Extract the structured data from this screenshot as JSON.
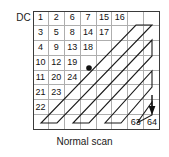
{
  "figure": {
    "dc_label": "DC",
    "caption": "Normal scan",
    "grid": {
      "rows": 8,
      "cols": 8,
      "cells": [
        [
          "1",
          "2",
          "6",
          "7",
          "15",
          "16",
          "",
          ""
        ],
        [
          "3",
          "5",
          "8",
          "14",
          "17",
          "",
          "",
          ""
        ],
        [
          "4",
          "9",
          "13",
          "18",
          "",
          "",
          "",
          ""
        ],
        [
          "10",
          "12",
          "19",
          "",
          "",
          "",
          "",
          ""
        ],
        [
          "11",
          "20",
          "24",
          "",
          "",
          "",
          "",
          ""
        ],
        [
          "21",
          "23",
          "",
          "",
          "",
          "",
          "",
          ""
        ],
        [
          "22",
          "",
          "",
          "",
          "",
          "",
          "",
          ""
        ],
        [
          "",
          "",
          "",
          "",
          "",
          "",
          "63",
          "64"
        ]
      ]
    },
    "markers": {
      "dot_label": "scan-position-dot",
      "dot_cell": {
        "row": 3,
        "col": 3
      },
      "arrow_label": "scan-end-arrow",
      "arrow_cell": {
        "row": 5,
        "col": 7
      }
    },
    "colors": {
      "grid_line": "#aeaeae",
      "grid_border": "#3a3a3a",
      "path_line": "#1a1a1a",
      "text": "#111111",
      "background": "#ffffff"
    }
  }
}
